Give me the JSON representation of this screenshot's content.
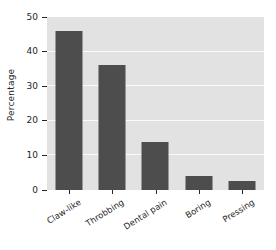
{
  "chart_data": {
    "type": "bar",
    "title": "",
    "subtitle": "",
    "xlabel": "",
    "ylabel": "Percentage",
    "categories": [
      "Claw-like",
      "Throbbing",
      "Dental pain",
      "Boring",
      "Pressing"
    ],
    "values": [
      46,
      36,
      14,
      4,
      2.5
    ],
    "series": [
      {
        "name": "Percentage",
        "values": [
          46,
          36,
          14,
          4,
          2.5
        ]
      }
    ],
    "ylim": [
      0,
      50
    ],
    "ytick_labels": [
      "0",
      "10",
      "20",
      "30",
      "40",
      "50"
    ],
    "ytick_values": [
      0,
      10,
      20,
      30,
      40,
      50
    ],
    "grid": "horizontal",
    "legend": "none",
    "colors": {
      "bar": "#4d4d4d",
      "plot_background": "#e2e2e2",
      "gridline": "#fafafa",
      "axis_text": "#262626",
      "figure_background": "#ffffff"
    }
  }
}
